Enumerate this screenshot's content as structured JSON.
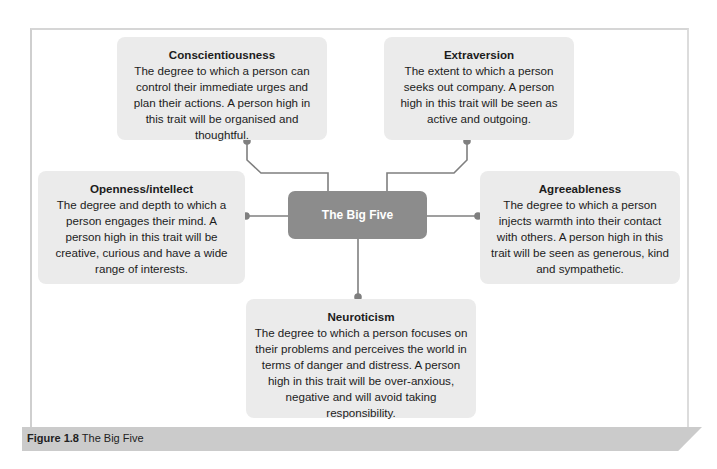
{
  "figure": {
    "caption_label": "Figure 1.8",
    "caption_text": "The Big Five"
  },
  "center": {
    "label": "The Big Five"
  },
  "traits": {
    "conscientiousness": {
      "title": "Conscientiousness",
      "description": "The degree to which a person can control their immediate urges and plan their actions. A person high in this trait will be organised and thoughtful."
    },
    "extraversion": {
      "title": "Extraversion",
      "description": "The extent to which a person seeks out company. A person high in this trait will be seen as active and outgoing."
    },
    "openness": {
      "title": "Openness/intellect",
      "description": "The degree and depth to which a person engages their mind. A person high in this trait will be creative, curious and have a wide range of interests."
    },
    "agreeableness": {
      "title": "Agreeableness",
      "description": "The degree to which a person injects warmth into their contact with others. A person high in this trait will be seen as generous, kind and sympathetic."
    },
    "neuroticism": {
      "title": "Neuroticism",
      "description": "The degree to which a person focuses on their problems and perceives the world in terms of danger and distress. A person high in this trait will be over-anxious, negative and will avoid taking responsibility."
    }
  },
  "colors": {
    "box_fill": "#ebebeb",
    "center_fill": "#8c8c8c",
    "connector": "#7a7a7a",
    "caption_bar": "#cbcbcb"
  }
}
